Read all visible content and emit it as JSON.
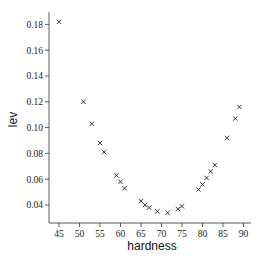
{
  "chart_data": {
    "type": "scatter",
    "title": "",
    "xlabel": "hardness",
    "ylabel": "lev",
    "xlim": [
      43.5,
      92
    ],
    "ylim": [
      0.027,
      0.187
    ],
    "grid": false,
    "legend": null,
    "marker": "x",
    "xticks": [
      45,
      50,
      55,
      60,
      65,
      70,
      75,
      80,
      85,
      90
    ],
    "xtick_labels": [
      "45",
      "50",
      "55",
      "60",
      "65",
      "70",
      "75",
      "80",
      "85",
      "90"
    ],
    "yticks": [
      0.04,
      0.06,
      0.08,
      0.1,
      0.12,
      0.14,
      0.16,
      0.18
    ],
    "ytick_labels": [
      "0.04",
      "0.06",
      "0.08",
      "0.10",
      "0.12",
      "0.14",
      "0.16",
      "0.18"
    ],
    "points": [
      {
        "x": 45,
        "y": 0.182
      },
      {
        "x": 51,
        "y": 0.12
      },
      {
        "x": 53,
        "y": 0.103
      },
      {
        "x": 55,
        "y": 0.088
      },
      {
        "x": 56,
        "y": 0.081
      },
      {
        "x": 59,
        "y": 0.063
      },
      {
        "x": 60,
        "y": 0.058
      },
      {
        "x": 61,
        "y": 0.053
      },
      {
        "x": 65,
        "y": 0.043
      },
      {
        "x": 66,
        "y": 0.04
      },
      {
        "x": 67,
        "y": 0.038
      },
      {
        "x": 69,
        "y": 0.035
      },
      {
        "x": 71.5,
        "y": 0.034
      },
      {
        "x": 74,
        "y": 0.037
      },
      {
        "x": 75,
        "y": 0.039
      },
      {
        "x": 79,
        "y": 0.052
      },
      {
        "x": 80,
        "y": 0.056
      },
      {
        "x": 81,
        "y": 0.061
      },
      {
        "x": 82,
        "y": 0.066
      },
      {
        "x": 83,
        "y": 0.071
      },
      {
        "x": 86,
        "y": 0.092
      },
      {
        "x": 88,
        "y": 0.107
      },
      {
        "x": 89,
        "y": 0.116
      }
    ]
  },
  "layout": {
    "plot_left": 49,
    "plot_right": 251,
    "plot_top": 12,
    "plot_bottom": 223,
    "x_px_at_45": 59,
    "x_px_per_unit": 4.1,
    "y_px_at_0_04": 205,
    "y_px_per_unit": 1290
  },
  "colors": {
    "axis": "#333333",
    "marker": "#222222",
    "text": "#222222",
    "background": "#ffffff"
  }
}
